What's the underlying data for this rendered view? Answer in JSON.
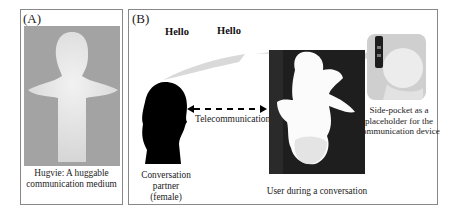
{
  "panel_a": {
    "label": "(A)",
    "caption_line1": "Hugvie: A huggable",
    "caption_line2": "communication medium",
    "photo_bg": "#a3a3a3"
  },
  "panel_b": {
    "label": "(B)",
    "speech": [
      "Hello",
      "Hello"
    ],
    "link_label": "Telecommunication",
    "partner_caption": [
      "Conversation",
      "partner",
      "(female)"
    ],
    "user_caption": "User during a conversation",
    "inset_caption": [
      "Side-pocket as a",
      "placeholder for the",
      "communication device"
    ]
  }
}
